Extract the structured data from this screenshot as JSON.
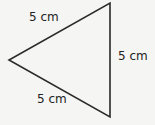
{
  "diagram": {
    "shape": "equilateral triangle",
    "stroke_color": "#2a2a2a",
    "background": "#f5f5f4",
    "sides": [
      {
        "name": "upper-left",
        "label": "5 cm"
      },
      {
        "name": "right",
        "label": "5 cm"
      },
      {
        "name": "lower-left",
        "label": "5 cm"
      }
    ]
  }
}
